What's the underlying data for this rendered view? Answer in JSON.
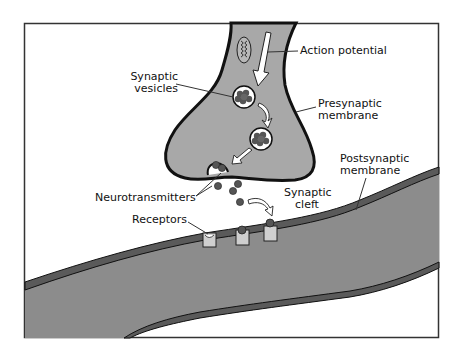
{
  "diagram": {
    "type": "synapse-illustration",
    "colors": {
      "cell_fill": "#a8a8a8",
      "postsynaptic_fill": "#8c8c8c",
      "membrane_dark": "#5a5a5a",
      "outline": "#111111",
      "receptor_fill": "#cfcfcf",
      "neurotransmitter": "#555555",
      "background": "#ffffff"
    },
    "labels": {
      "action_potential": "Action potential",
      "synaptic_vesicles_1": "Synaptic",
      "synaptic_vesicles_2": "vesicles",
      "presynaptic_1": "Presynaptic",
      "presynaptic_2": "membrane",
      "postsynaptic_1": "Postsynaptic",
      "postsynaptic_2": "membrane",
      "neurotransmitters": "Neurotransmitters",
      "synaptic_cleft_1": "Synaptic",
      "synaptic_cleft_2": "cleft",
      "receptors": "Receptors"
    }
  }
}
